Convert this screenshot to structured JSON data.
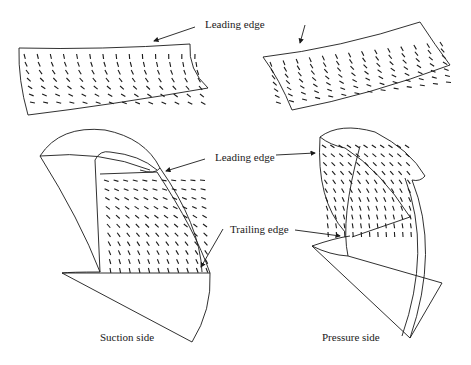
{
  "figure": {
    "labels": {
      "leading_edge_top": "Leading edge",
      "leading_edge_mid": "Leading edge",
      "trailing_edge": "Trailing edge",
      "suction_side": "Suction side",
      "pressure_side": "Pressure side"
    },
    "panels": [
      {
        "id": "top-left",
        "description": "Unwrapped suction-side surface with velocity vectors"
      },
      {
        "id": "top-right",
        "description": "Unwrapped pressure-side surface with velocity vectors"
      },
      {
        "id": "bottom-left",
        "description": "3D impeller blade, suction side view"
      },
      {
        "id": "bottom-right",
        "description": "3D impeller blade, pressure side view"
      }
    ],
    "colors": {
      "ink": "#1a1a1a",
      "background": "#ffffff"
    }
  }
}
